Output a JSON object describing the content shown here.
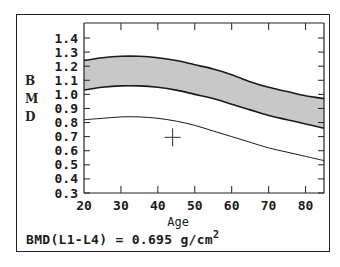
{
  "chart_data": {
    "type": "area",
    "title": "",
    "xlabel": "Age",
    "ylabel": "BMD",
    "xlim": [
      20,
      85
    ],
    "ylim": [
      0.3,
      1.4
    ],
    "x_ticks": [
      20,
      30,
      40,
      50,
      60,
      70,
      80
    ],
    "y_ticks": [
      1.4,
      1.3,
      1.2,
      1.1,
      1.0,
      0.9,
      0.8,
      0.7,
      0.6,
      0.5,
      0.4,
      0.3
    ],
    "x_tick_labels": [
      "20",
      "30",
      "40",
      "50",
      "60",
      "70",
      "80"
    ],
    "y_tick_labels": [
      "1.4",
      "1.3",
      "1.2",
      "1.1",
      "1.0",
      "0.9",
      "0.8",
      "0.7",
      "0.6",
      "0.5",
      "0.4",
      "0.3"
    ],
    "grid": false,
    "x": [
      20,
      25,
      30,
      35,
      40,
      45,
      50,
      55,
      60,
      65,
      70,
      75,
      80,
      85
    ],
    "series": [
      {
        "name": "Upper reference (+1 SD)",
        "style": "band-top",
        "values": [
          1.24,
          1.26,
          1.27,
          1.27,
          1.26,
          1.24,
          1.21,
          1.18,
          1.14,
          1.09,
          1.05,
          1.02,
          0.99,
          0.97
        ]
      },
      {
        "name": "Mean reference",
        "style": "band-bottom",
        "values": [
          1.03,
          1.05,
          1.06,
          1.06,
          1.05,
          1.03,
          1.0,
          0.97,
          0.93,
          0.89,
          0.85,
          0.82,
          0.79,
          0.76
        ]
      },
      {
        "name": "Lower reference (-1 SD)",
        "style": "line",
        "values": [
          0.82,
          0.83,
          0.84,
          0.84,
          0.83,
          0.81,
          0.78,
          0.74,
          0.7,
          0.66,
          0.62,
          0.59,
          0.56,
          0.53
        ]
      }
    ],
    "shaded_band": {
      "between": [
        "Upper reference (+1 SD)",
        "Mean reference"
      ],
      "color": "#c8c8c8"
    },
    "patient_marker": {
      "x": 44,
      "y": 0.695,
      "marker": "crosshair"
    },
    "annotation": "BMD(L1-L4) = 0.695 g/cm2"
  },
  "labels": {
    "ylabel_letters": [
      "B",
      "M",
      "D"
    ],
    "xlabel": "Age",
    "footer_prefix": "BMD(L1-L4) = 0.695 g/cm",
    "footer_superscript": "2"
  },
  "colors": {
    "band_fill": "#c8c8c8",
    "line": "#1a1a1a",
    "frame": "#222222",
    "background": "#ffffff"
  }
}
